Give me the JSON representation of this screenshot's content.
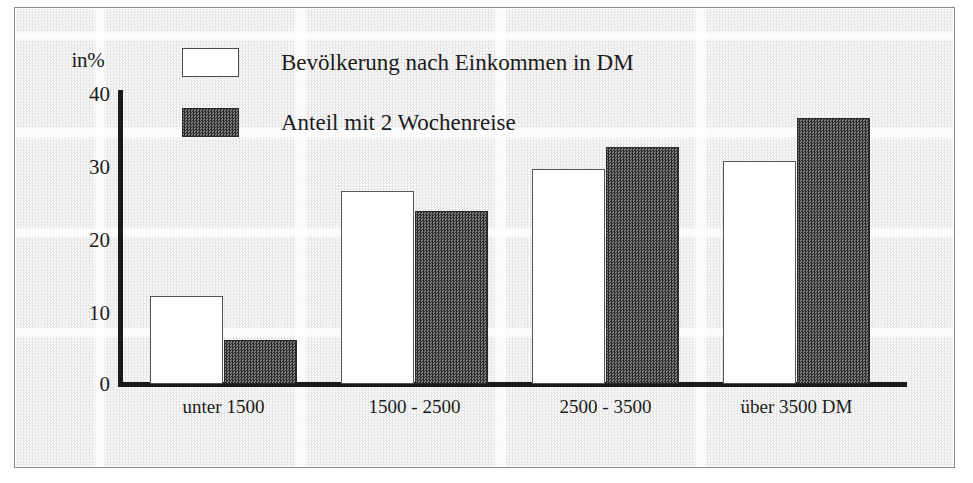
{
  "chart_data": {
    "type": "bar",
    "title": "",
    "xlabel": "",
    "ylabel": "in%",
    "ylim": [
      0,
      40
    ],
    "yticks": [
      0,
      10,
      20,
      30,
      40
    ],
    "ytick_labels": [
      "0",
      "10",
      "20",
      "30",
      "40"
    ],
    "grid": false,
    "legend_position": "top-left-inside",
    "categories": [
      "unter 1500",
      "1500 - 2500",
      "2500 - 3500",
      "über 3500 DM"
    ],
    "series": [
      {
        "name": "Bevölkerung nach Einkommen in DM",
        "swatch": "light",
        "color": "#ffffff",
        "values": [
          12.0,
          26.5,
          29.5,
          30.5
        ]
      },
      {
        "name": "Anteil mit 2 Wochenreise",
        "swatch": "dark",
        "color": "#4a4a4a",
        "values": [
          6.0,
          23.7,
          32.5,
          36.5
        ]
      }
    ]
  },
  "axis": {
    "unit_label": "in%",
    "tick_labels": [
      "40",
      "30",
      "20",
      "10",
      "0"
    ]
  },
  "legend": {
    "entries": [
      {
        "label": "Bevölkerung nach Einkommen in DM",
        "swatch": "light"
      },
      {
        "label": "Anteil mit 2 Wochenreise",
        "swatch": "dark"
      }
    ]
  },
  "colors": {
    "ink": "#1b1b1b",
    "bar_light": "#ffffff",
    "bar_dark": "#4a4a4a",
    "paper": "#f4f4f4",
    "frame": "#8a8a8a"
  }
}
